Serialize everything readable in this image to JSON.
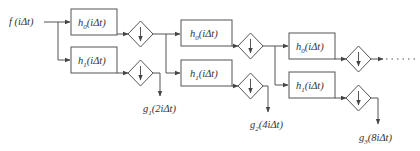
{
  "diagram": {
    "input_label": "f (iΔt)",
    "stages": [
      {
        "lowpass": {
          "name": "h",
          "sub": "0",
          "arg": "(iΔt)"
        },
        "highpass": {
          "name": "h",
          "sub": "1",
          "arg": "(iΔt)"
        },
        "output": {
          "name": "g",
          "sub": "1",
          "arg": "(2iΔt)"
        }
      },
      {
        "lowpass": {
          "name": "h",
          "sub": "0",
          "arg": "(iΔt)"
        },
        "highpass": {
          "name": "h",
          "sub": "1",
          "arg": "(iΔt)"
        },
        "output": {
          "name": "g",
          "sub": "2",
          "arg": "(4iΔt)"
        }
      },
      {
        "lowpass": {
          "name": "h",
          "sub": "0",
          "arg": "(iΔt)"
        },
        "highpass": {
          "name": "h",
          "sub": "1",
          "arg": "(iΔt)"
        },
        "output": {
          "name": "g",
          "sub": "3",
          "arg": "(8iΔt)"
        }
      }
    ],
    "downsampler_symbol": "↓",
    "continuation": "……",
    "colors": {
      "stroke": "#555555",
      "text": "#333333",
      "background": "#ffffff"
    }
  }
}
